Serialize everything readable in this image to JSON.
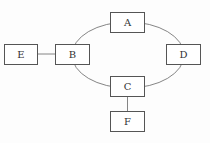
{
  "nodes": [
    {
      "id": "A",
      "label": "A"
    },
    {
      "id": "B",
      "label": "B"
    },
    {
      "id": "C",
      "label": "C"
    },
    {
      "id": "D",
      "label": "D"
    },
    {
      "id": "E",
      "label": "E"
    },
    {
      "id": "F",
      "label": "F"
    }
  ],
  "edges": [
    {
      "from": "A",
      "to": "B",
      "type": "ring"
    },
    {
      "from": "A",
      "to": "D",
      "type": "ring"
    },
    {
      "from": "B",
      "to": "C",
      "type": "ring"
    },
    {
      "from": "D",
      "to": "C",
      "type": "ring"
    },
    {
      "from": "E",
      "to": "B",
      "type": "line"
    },
    {
      "from": "C",
      "to": "F",
      "type": "line"
    }
  ],
  "colors": {
    "stroke": "#555555",
    "text": "#333333"
  }
}
